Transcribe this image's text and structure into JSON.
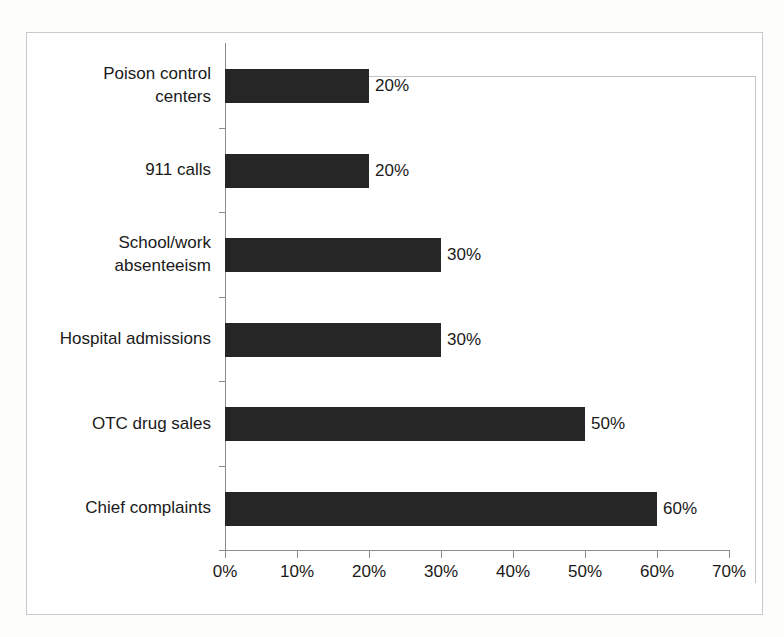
{
  "chart_data": {
    "type": "bar",
    "orientation": "horizontal",
    "title": "",
    "subtitle": "",
    "xlabel": "",
    "ylabel": "",
    "categories": [
      "Poison control\ncenters",
      "911 calls",
      "School/work\nabsenteeism",
      "Hospital admissions",
      "OTC drug sales",
      "Chief complaints"
    ],
    "values": [
      20,
      20,
      30,
      30,
      50,
      60
    ],
    "data_labels": [
      "20%",
      "20%",
      "30%",
      "30%",
      "50%",
      "60%"
    ],
    "xlim": [
      0,
      70
    ],
    "xtick_values": [
      0,
      10,
      20,
      30,
      40,
      50,
      60,
      70
    ],
    "xtick_labels": [
      "0%",
      "10%",
      "20%",
      "30%",
      "40%",
      "50%",
      "60%",
      "70%"
    ],
    "grid": false,
    "legend": false,
    "legend_position": "none",
    "bar_color": "#262626",
    "axis_color": "#8c8c8c",
    "plot_border_color": "#c4c4c4",
    "frame_color": "#c9c9c9",
    "background_color": "#ffffff"
  }
}
